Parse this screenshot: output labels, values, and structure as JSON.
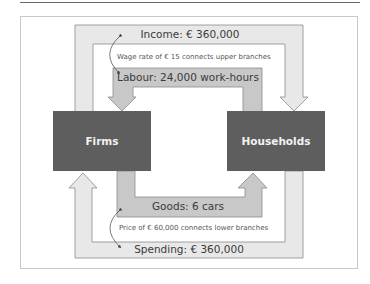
{
  "diagram": {
    "nodes": [
      {
        "id": "firms",
        "label": "Firms"
      },
      {
        "id": "households",
        "label": "Households"
      }
    ],
    "flows": {
      "income": {
        "label": "Income: € 360,000",
        "from": "Households-side",
        "to": "Households",
        "direction": "firms-to-households"
      },
      "labour": {
        "label": "Labour: 24,000 work-hours",
        "direction": "households-to-firms"
      },
      "goods": {
        "label": "Goods: 6 cars",
        "direction": "firms-to-households"
      },
      "spending": {
        "label": "Spending: € 360,000",
        "direction": "households-to-firms"
      }
    },
    "connectors": {
      "upper": {
        "label": "Wage rate of € 15 connects upper branches"
      },
      "lower": {
        "label": "Price of € 60,000 connects lower branches"
      }
    },
    "colors": {
      "box_fill": "#5e5e5e",
      "outer_flow_fill": "#e8e8e8",
      "inner_flow_fill": "#c8c8c8",
      "stroke": "#8a8a8a",
      "box_text": "#f2f2f2"
    }
  }
}
